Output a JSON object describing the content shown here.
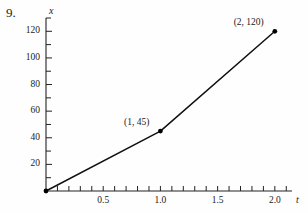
{
  "problem": {
    "number": "9."
  },
  "chart_data": {
    "type": "line",
    "title": "",
    "xlabel": "t",
    "ylabel": "x",
    "xlim": [
      0,
      2.15
    ],
    "ylim": [
      0,
      130
    ],
    "grid": false,
    "legend": false,
    "x": [
      0,
      1,
      2
    ],
    "values": [
      0,
      45,
      120
    ],
    "series": [
      {
        "name": "x(t)",
        "points": [
          {
            "x": 0,
            "y": 0,
            "label": "",
            "marker": false
          },
          {
            "x": 1,
            "y": 45,
            "label": "(1, 45)",
            "marker": true
          },
          {
            "x": 2,
            "y": 120,
            "label": "(2, 120)",
            "marker": true
          }
        ]
      }
    ],
    "y_axis": {
      "label": "x",
      "labeled_ticks": [
        20,
        40,
        60,
        80,
        100,
        120
      ],
      "labeled_tick_text": [
        "20",
        "40",
        "60",
        "80",
        "100",
        "120"
      ],
      "minor_tick_step": 10,
      "minor_ticks": [
        10,
        20,
        30,
        40,
        50,
        60,
        70,
        80,
        90,
        100,
        110,
        120,
        130
      ]
    },
    "x_axis": {
      "label": "t",
      "labeled_ticks": [
        0.5,
        1.0,
        1.5,
        2.0
      ],
      "labeled_tick_text": [
        "0.5",
        "1.0",
        "1.5",
        "2.0"
      ],
      "minor_tick_step": 0.1,
      "minor_ticks": [
        0.1,
        0.2,
        0.3,
        0.4,
        0.5,
        0.6,
        0.7,
        0.8,
        0.9,
        1.0,
        1.1,
        1.2,
        1.3,
        1.4,
        1.5,
        1.6,
        1.7,
        1.8,
        1.9,
        2.0,
        2.1
      ]
    },
    "annotations": [
      {
        "text": "(1, 45)",
        "x": 1,
        "y": 45
      },
      {
        "text": "(2, 120)",
        "x": 2,
        "y": 120
      }
    ]
  },
  "colors": {
    "line": "#111111",
    "axis": "#222222",
    "text": "#1a1a1a",
    "background": "#fefefe"
  }
}
